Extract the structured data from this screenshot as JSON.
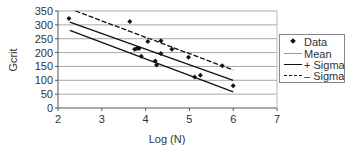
{
  "chart_data": {
    "type": "scatter",
    "title": "",
    "xlabel": "Log (N)",
    "ylabel": "Gcrit",
    "xlim": [
      2,
      7
    ],
    "ylim": [
      0,
      350
    ],
    "xticks": [
      2,
      3,
      4,
      5,
      6,
      7
    ],
    "yticks": [
      0,
      50,
      100,
      150,
      200,
      250,
      300,
      350
    ],
    "grid": {
      "horizontal": true,
      "vertical": false
    },
    "legend_position": "right",
    "series": [
      {
        "name": "Data",
        "kind": "scatter",
        "marker": "diamond",
        "points": [
          [
            2.25,
            323
          ],
          [
            3.64,
            312
          ],
          [
            3.75,
            212
          ],
          [
            3.8,
            215
          ],
          [
            3.85,
            215
          ],
          [
            3.9,
            187
          ],
          [
            4.05,
            240
          ],
          [
            4.22,
            170
          ],
          [
            4.25,
            155
          ],
          [
            4.35,
            243
          ],
          [
            4.35,
            197
          ],
          [
            4.6,
            212
          ],
          [
            4.98,
            183
          ],
          [
            5.12,
            112
          ],
          [
            5.25,
            118
          ],
          [
            5.75,
            152
          ],
          [
            6.0,
            80
          ]
        ]
      },
      {
        "name": "Mean",
        "kind": "line",
        "style": "solid",
        "points": [
          [
            2.27,
            310
          ],
          [
            6.0,
            100
          ]
        ]
      },
      {
        "name": "+ Sigma",
        "kind": "line",
        "style": "solid",
        "points": [
          [
            2.27,
            280
          ],
          [
            6.0,
            58
          ]
        ]
      },
      {
        "name": "– Sigma",
        "kind": "line",
        "style": "dashed",
        "points": [
          [
            2.4,
            350
          ],
          [
            6.0,
            137
          ]
        ]
      }
    ]
  },
  "legend": {
    "items": [
      {
        "label": "Data",
        "swatch": "dot"
      },
      {
        "label": "Mean",
        "swatch": "light-solid"
      },
      {
        "label": "+ Sigma",
        "swatch": "solid"
      },
      {
        "label": "– Sigma",
        "swatch": "dashed"
      }
    ]
  },
  "axes": {
    "xlabel": "Log (N)",
    "ylabel": "Gcrit"
  }
}
